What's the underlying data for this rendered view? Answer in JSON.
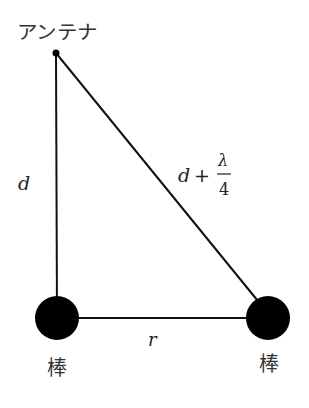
{
  "diagram": {
    "labels": {
      "antenna": "アンテナ",
      "rod_left": "棒",
      "rod_right": "棒",
      "vertical_distance": "d",
      "horizontal_distance": "r",
      "hypotenuse_d": "d",
      "hypotenuse_plus": "+",
      "hypotenuse_numerator": "λ",
      "hypotenuse_denominator": "4"
    },
    "colors": {
      "line": "#111111",
      "node": "#000000",
      "text": "#222222"
    },
    "nodes": {
      "antenna": {
        "x": 56,
        "y": 53,
        "r": 3.5
      },
      "rod_left": {
        "x": 57,
        "y": 318,
        "r": 22
      },
      "rod_right": {
        "x": 268,
        "y": 318,
        "r": 22
      }
    },
    "edges": [
      {
        "from": "antenna",
        "to": "rod_left",
        "label": "d"
      },
      {
        "from": "antenna",
        "to": "rod_right",
        "label": "d + λ/4"
      },
      {
        "from": "rod_left",
        "to": "rod_right",
        "label": "r"
      }
    ]
  }
}
